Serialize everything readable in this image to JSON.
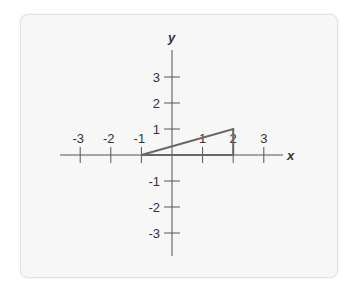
{
  "figure": {
    "x_axis_label": "x",
    "y_axis_label": "y",
    "x_ticks": [
      {
        "value": -3,
        "label": "-3"
      },
      {
        "value": -2,
        "label": "-2"
      },
      {
        "value": -1,
        "label": "-1"
      },
      {
        "value": 1,
        "label": "1"
      },
      {
        "value": 2,
        "label": "2"
      },
      {
        "value": 3,
        "label": "3"
      }
    ],
    "y_ticks": [
      {
        "value": 3,
        "label": "3"
      },
      {
        "value": 2,
        "label": "2"
      },
      {
        "value": 1,
        "label": "1"
      },
      {
        "value": -1,
        "label": "-1"
      },
      {
        "value": -2,
        "label": "-2"
      },
      {
        "value": -3,
        "label": "-3"
      }
    ],
    "triangle": {
      "vertices": [
        [
          -1,
          0
        ],
        [
          2,
          1
        ],
        [
          2,
          0
        ]
      ],
      "stroke_color": "#666666"
    },
    "axis_color": "#555555"
  }
}
